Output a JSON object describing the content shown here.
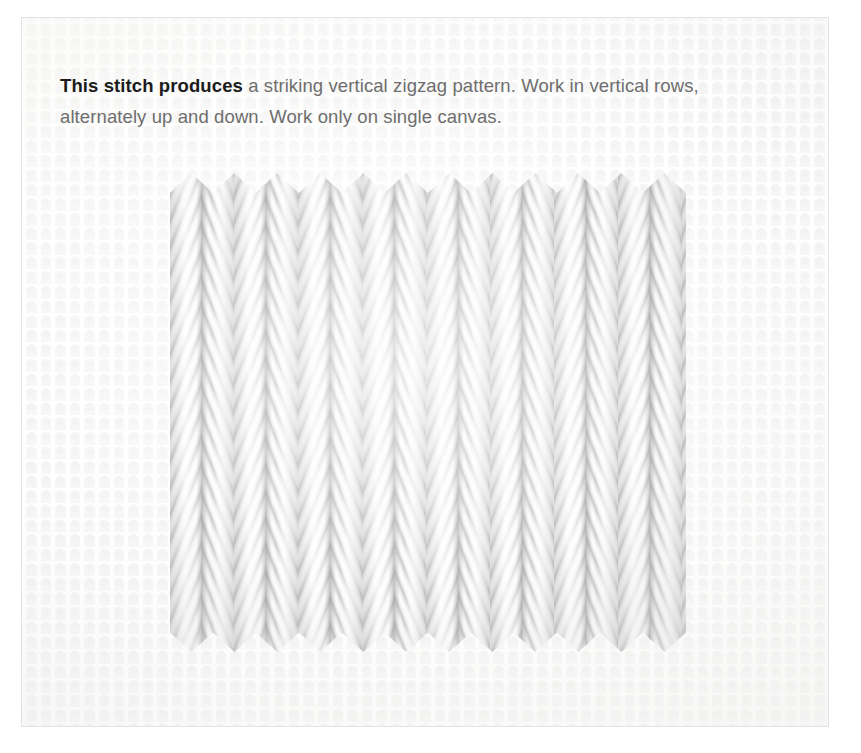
{
  "figure": {
    "name": "needlepoint-stitch-sample-photo",
    "canvas_color": "#f1f0f0",
    "yarn_color": "#e9e9e9",
    "shadow_color": "#aaaaaa"
  },
  "caption": {
    "lead": "This stitch produces",
    "line1_rest": " a striking vertical zigzag pattern. Work in vertical rows,",
    "line2": "alternately up and down. Work only on single canvas.",
    "text_color": "#6e6e6e",
    "lead_color": "#1c1c1c"
  }
}
